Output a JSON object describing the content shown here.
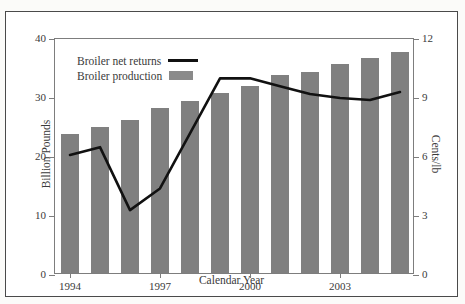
{
  "top_caption_fragment": "",
  "chart_data": {
    "type": "bar",
    "title": "",
    "xlabel": "Calendar Year",
    "ylabel": "Billion Pounds",
    "y2label": "Cents/lb",
    "categories": [
      1994,
      1995,
      1996,
      1997,
      1998,
      1999,
      2000,
      2001,
      2002,
      2003,
      2004,
      2005
    ],
    "x_tick_labels": [
      "1994",
      "1997",
      "2000",
      "2003"
    ],
    "x_tick_values": [
      1994,
      1997,
      2000,
      2003
    ],
    "ylim": [
      0,
      40
    ],
    "y_ticks": [
      0,
      10,
      20,
      30,
      40
    ],
    "y2lim": [
      0,
      12
    ],
    "y2_ticks": [
      0,
      3,
      6,
      9,
      12
    ],
    "grid": false,
    "legend_position": "upper-left",
    "series": [
      {
        "name": "Broiler production",
        "type": "bar",
        "axis": "left",
        "unit": "Billion Pounds",
        "color": "#808080",
        "values": [
          23.5,
          24.8,
          26.0,
          27.9,
          29.2,
          30.5,
          31.7,
          33.6,
          34.0,
          35.4,
          36.4,
          37.5
        ]
      },
      {
        "name": "Broiler net returns",
        "type": "line",
        "axis": "right",
        "unit": "Cents/lb",
        "color": "#111111",
        "values": [
          6.1,
          6.5,
          3.3,
          4.4,
          7.2,
          10.0,
          10.0,
          9.6,
          9.2,
          9.0,
          8.9,
          9.3
        ]
      }
    ]
  },
  "legend": {
    "items": [
      {
        "label": "Broiler net returns",
        "swatch": "line"
      },
      {
        "label": "Broiler production",
        "swatch": "bar"
      }
    ]
  },
  "axes": {
    "left_title": "Billion Pounds",
    "right_title": "Cents/lb",
    "bottom_title": "Calendar Year",
    "left_ticks": [
      "40",
      "30",
      "20",
      "10",
      "0"
    ],
    "right_ticks": [
      "12",
      "9",
      "6",
      "3",
      "0"
    ],
    "bottom_ticks": [
      "1994",
      "1997",
      "2000",
      "2003"
    ]
  },
  "colors": {
    "bar": "#808080",
    "line": "#111111",
    "frame": "#4a4a4a",
    "axis": "#7d7d7d",
    "background": "#ffffff",
    "text": "#3a3a3a"
  }
}
